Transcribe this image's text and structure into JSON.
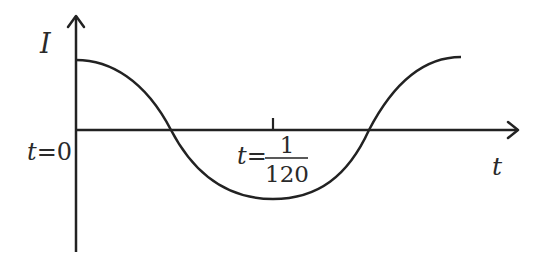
{
  "diagram": {
    "colors": {
      "stroke": "#222222",
      "text": "#2a2a2a",
      "background": "#ffffff"
    },
    "y_axis": {
      "label": "I"
    },
    "x_axis": {
      "label": "t"
    },
    "origin_label": {
      "var": "t",
      "eq": "=",
      "value": "0"
    },
    "tick_label": {
      "var": "t",
      "eq": "=",
      "numerator": "1",
      "denominator": "120"
    },
    "curve": {
      "function": "cosine",
      "start": "maximum at t=0",
      "half_period_marker": "t = 1/120 (minimum)"
    }
  }
}
